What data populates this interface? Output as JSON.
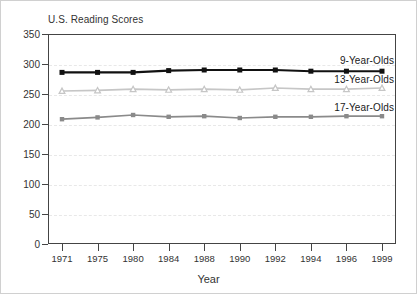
{
  "chart_data": {
    "type": "line",
    "title": "U.S. Reading Scores",
    "xlabel": "Year",
    "ylabel": "",
    "x": [
      "1971",
      "1975",
      "1980",
      "1984",
      "1988",
      "1990",
      "1992",
      "1994",
      "1996",
      "1999"
    ],
    "categories": [
      "1971",
      "1975",
      "1980",
      "1984",
      "1988",
      "1990",
      "1992",
      "1994",
      "1996",
      "1999"
    ],
    "ylim": [
      0,
      350
    ],
    "yticks": [
      "0",
      "50",
      "100",
      "150",
      "200",
      "250",
      "300",
      "350"
    ],
    "grid": true,
    "legend_position": "inline-right",
    "series": [
      {
        "name": "9-Year-Olds",
        "color": "#111111",
        "marker": "square",
        "values": [
          286,
          286,
          286,
          289,
          290,
          290,
          290,
          288,
          288,
          288
        ]
      },
      {
        "name": "13-Year-Olds",
        "color": "#c6c6c6",
        "marker": "triangle",
        "values": [
          255,
          256,
          258,
          257,
          258,
          257,
          260,
          258,
          258,
          260
        ]
      },
      {
        "name": "17-Year-Olds",
        "color": "#8a8a8a",
        "marker": "square",
        "values": [
          208,
          211,
          215,
          212,
          213,
          210,
          212,
          212,
          213,
          213
        ]
      }
    ]
  },
  "colors": {
    "axis": "#444444",
    "grid": "#e8e8e8",
    "text": "#333333",
    "border": "#d0d0d0",
    "background": "#ffffff"
  }
}
